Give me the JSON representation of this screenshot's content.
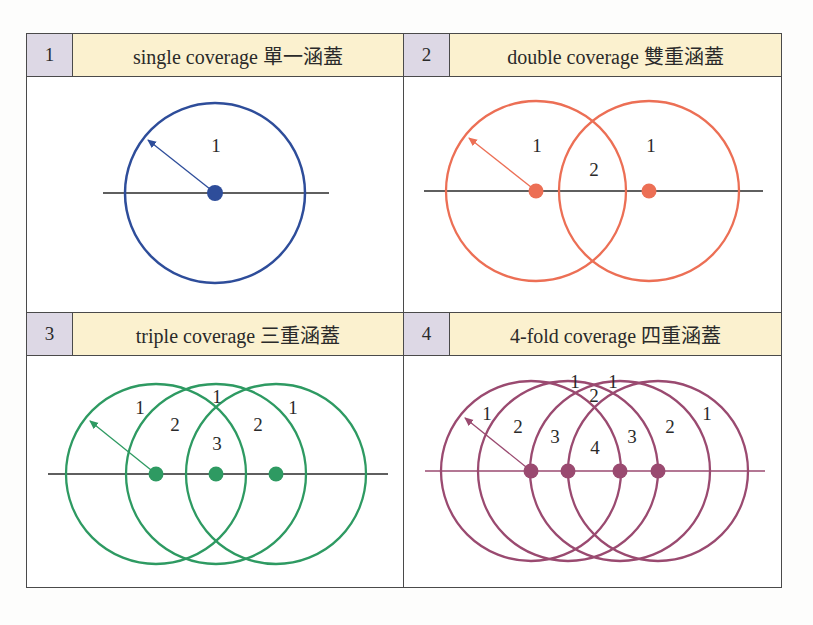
{
  "panels": [
    {
      "number": "1",
      "title": "single coverage 單一涵蓋",
      "color": "#2e4d9a",
      "region_labels": [
        "1"
      ]
    },
    {
      "number": "2",
      "title": "double coverage 雙重涵蓋",
      "color": "#ec6f55",
      "region_labels": [
        "1",
        "2",
        "1"
      ]
    },
    {
      "number": "3",
      "title": "triple coverage 三重涵蓋",
      "color": "#2e9a62",
      "region_labels": [
        "1",
        "2",
        "1",
        "3",
        "2",
        "1"
      ]
    },
    {
      "number": "4",
      "title": "4-fold coverage 四重涵蓋",
      "color": "#9a4a70",
      "region_labels": [
        "1",
        "2",
        "3",
        "1",
        "2",
        "1",
        "4",
        "3",
        "2",
        "1"
      ]
    }
  ],
  "colors": {
    "border": "#4a4a4a",
    "number_cell_bg": "#ddd8e5",
    "title_cell_bg": "#fbf1cf",
    "axis_line": "#2a2a2a"
  }
}
